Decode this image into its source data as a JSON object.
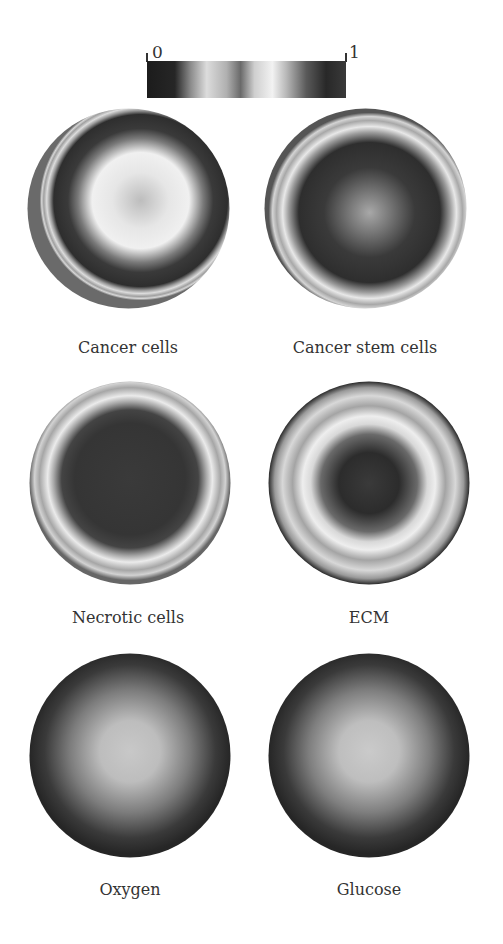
{
  "figure": {
    "colorbar": {
      "min_label": "0",
      "max_label": "1",
      "colormap": "grayscale-banded",
      "stops": [
        "#1e1e1e",
        "#262626",
        "#8a8a8a",
        "#e0e0e0",
        "#9a9a9a",
        "#5e5e5e",
        "#d8d8d8",
        "#f2f2f2",
        "#bdbdbd",
        "#5a5a5a",
        "#2a2a2a",
        "#383838"
      ]
    },
    "panels": [
      {
        "label": "Cancer cells"
      },
      {
        "label": "Cancer stem cells"
      },
      {
        "label": "Necrotic cells"
      },
      {
        "label": "ECM"
      },
      {
        "label": "Oxygen"
      },
      {
        "label": "Glucose"
      }
    ]
  }
}
